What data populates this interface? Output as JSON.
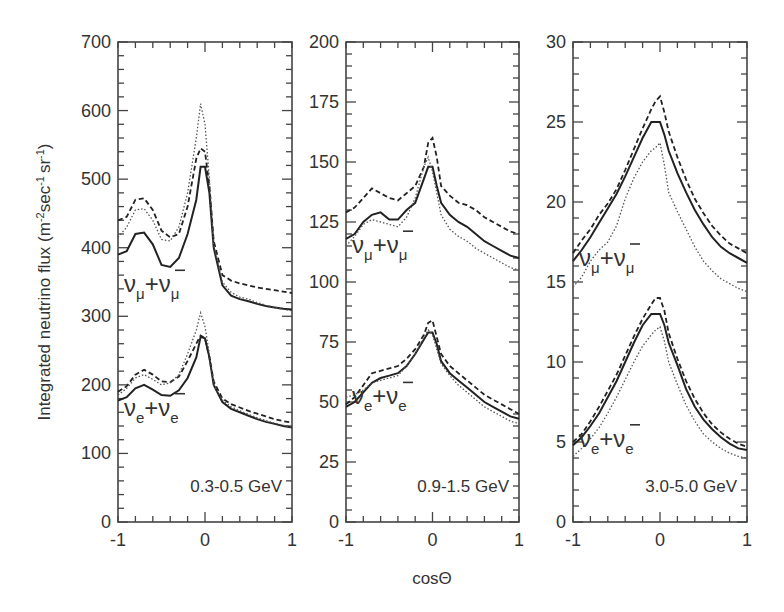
{
  "chart_data": [
    {
      "type": "line",
      "title": "0.3-0.5 GeV",
      "xlabel": "cosΘ",
      "ylabel": "Integrated neutrino flux (m^-2 sec^-1 sr^-1)",
      "xlim": [
        -1,
        1
      ],
      "ylim": [
        0,
        700
      ],
      "yticks": [
        0,
        100,
        200,
        300,
        400,
        500,
        600,
        700
      ],
      "xticks": [
        -1,
        0,
        1
      ],
      "x": [
        -1,
        -0.9,
        -0.8,
        -0.7,
        -0.6,
        -0.5,
        -0.4,
        -0.3,
        -0.2,
        -0.1,
        -0.05,
        0,
        0.05,
        0.1,
        0.2,
        0.3,
        0.4,
        0.5,
        0.6,
        0.7,
        0.8,
        0.9,
        1
      ],
      "groups": [
        {
          "label": "νμ+ν̄μ",
          "series": [
            {
              "name": "solid",
              "values": [
                390,
                395,
                420,
                422,
                405,
                375,
                372,
                385,
                420,
                470,
                518,
                518,
                480,
                400,
                345,
                330,
                325,
                322,
                318,
                315,
                313,
                311,
                310
              ]
            },
            {
              "name": "dashed",
              "values": [
                440,
                445,
                470,
                472,
                455,
                425,
                415,
                420,
                460,
                530,
                545,
                540,
                490,
                410,
                360,
                352,
                348,
                345,
                342,
                340,
                338,
                336,
                334
              ]
            },
            {
              "name": "dotted",
              "values": [
                415,
                430,
                455,
                457,
                440,
                412,
                410,
                430,
                480,
                560,
                610,
                580,
                500,
                405,
                350,
                335,
                328,
                325,
                320,
                316,
                313,
                310,
                308
              ]
            }
          ]
        },
        {
          "label": "νe+ν̄e",
          "series": [
            {
              "name": "solid",
              "values": [
                177,
                182,
                195,
                200,
                193,
                185,
                184,
                192,
                210,
                240,
                270,
                268,
                240,
                200,
                175,
                165,
                160,
                155,
                150,
                146,
                143,
                140,
                138
              ]
            },
            {
              "name": "dashed",
              "values": [
                190,
                198,
                215,
                222,
                215,
                205,
                204,
                212,
                235,
                260,
                272,
                268,
                240,
                205,
                180,
                172,
                167,
                162,
                158,
                154,
                150,
                147,
                145
              ]
            },
            {
              "name": "dotted",
              "values": [
                185,
                195,
                210,
                215,
                208,
                200,
                203,
                215,
                245,
                280,
                305,
                285,
                245,
                200,
                178,
                168,
                162,
                157,
                152,
                148,
                144,
                141,
                138
              ]
            }
          ]
        }
      ]
    },
    {
      "type": "line",
      "title": "0.9-1.5 GeV",
      "xlabel": "cosΘ",
      "xlim": [
        -1,
        1
      ],
      "ylim": [
        0,
        200
      ],
      "yticks": [
        0,
        25,
        50,
        75,
        100,
        125,
        150,
        175,
        200
      ],
      "xticks": [
        -1,
        0,
        1
      ],
      "x": [
        -1,
        -0.9,
        -0.8,
        -0.7,
        -0.6,
        -0.5,
        -0.4,
        -0.3,
        -0.2,
        -0.1,
        -0.05,
        0,
        0.05,
        0.1,
        0.2,
        0.3,
        0.4,
        0.5,
        0.6,
        0.7,
        0.8,
        0.9,
        1
      ],
      "groups": [
        {
          "label": "νμ+ν̄μ",
          "series": [
            {
              "name": "solid",
              "values": [
                118,
                120,
                125,
                128,
                129,
                126,
                126,
                130,
                133,
                143,
                148,
                148,
                140,
                133,
                128,
                125,
                123,
                120,
                117,
                115,
                113,
                111,
                110
              ]
            },
            {
              "name": "dashed",
              "values": [
                129,
                131,
                135,
                139,
                137,
                135,
                134,
                137,
                140,
                148,
                158,
                160,
                152,
                140,
                136,
                133,
                132,
                130,
                127,
                125,
                123,
                121,
                120
              ]
            },
            {
              "name": "dotted",
              "values": [
                115,
                119,
                124,
                126,
                125,
                124,
                123,
                127,
                135,
                148,
                152,
                146,
                137,
                128,
                122,
                119,
                117,
                114,
                112,
                110,
                108,
                106,
                105
              ]
            }
          ]
        },
        {
          "label": "νe+ν̄e",
          "series": [
            {
              "name": "solid",
              "values": [
                48,
                50,
                54,
                58,
                60,
                61,
                62,
                65,
                70,
                76,
                79,
                79,
                74,
                67,
                62,
                59,
                56,
                53,
                50,
                48,
                46,
                44,
                43
              ]
            },
            {
              "name": "dashed",
              "values": [
                49,
                52,
                57,
                62,
                63,
                64,
                65,
                68,
                72,
                78,
                83,
                84,
                77,
                70,
                65,
                62,
                59,
                56,
                53,
                51,
                49,
                47,
                45
              ]
            },
            {
              "name": "dotted",
              "values": [
                52,
                53,
                55,
                58,
                59,
                60,
                61,
                65,
                70,
                77,
                80,
                78,
                72,
                66,
                61,
                57,
                54,
                51,
                48,
                46,
                44,
                42,
                41
              ]
            }
          ]
        }
      ]
    },
    {
      "type": "line",
      "title": "3.0-5.0 GeV",
      "xlabel": "cosΘ",
      "xlim": [
        -1,
        1
      ],
      "ylim": [
        0,
        30
      ],
      "yticks": [
        0,
        5,
        10,
        15,
        20,
        25,
        30
      ],
      "xticks": [
        -1,
        0,
        1
      ],
      "x": [
        -1,
        -0.9,
        -0.8,
        -0.7,
        -0.6,
        -0.5,
        -0.4,
        -0.3,
        -0.2,
        -0.1,
        -0.05,
        0,
        0.05,
        0.1,
        0.2,
        0.3,
        0.4,
        0.5,
        0.6,
        0.7,
        0.8,
        0.9,
        1
      ],
      "groups": [
        {
          "label": "νμ+ν̄μ",
          "series": [
            {
              "name": "solid",
              "values": [
                16.3,
                17.0,
                17.8,
                18.7,
                19.6,
                20.5,
                21.6,
                22.8,
                24.0,
                25.0,
                25.0,
                25.0,
                24.2,
                23.2,
                21.8,
                20.6,
                19.5,
                18.6,
                17.8,
                17.2,
                16.8,
                16.5,
                16.2
              ]
            },
            {
              "name": "dashed",
              "values": [
                16.8,
                17.6,
                18.3,
                19.2,
                19.9,
                20.8,
                22.0,
                23.3,
                24.6,
                25.8,
                26.3,
                26.6,
                25.6,
                24.4,
                22.8,
                21.4,
                20.2,
                19.3,
                18.5,
                17.9,
                17.4,
                17.1,
                16.8
              ]
            },
            {
              "name": "dotted",
              "values": [
                14.7,
                15.3,
                16.3,
                17.0,
                17.5,
                18.5,
                20.2,
                21.5,
                22.5,
                23.2,
                23.4,
                23.7,
                22.3,
                20.6,
                19.4,
                18.3,
                17.2,
                16.3,
                15.7,
                15.2,
                14.9,
                14.6,
                14.4
              ]
            }
          ]
        },
        {
          "label": "νe+ν̄e",
          "series": [
            {
              "name": "solid",
              "values": [
                4.8,
                5.3,
                6.0,
                6.8,
                7.8,
                8.8,
                10.0,
                11.2,
                12.3,
                13.0,
                13.0,
                13.0,
                12.3,
                11.2,
                9.8,
                8.3,
                7.2,
                6.4,
                5.8,
                5.3,
                4.9,
                4.6,
                4.5
              ]
            },
            {
              "name": "dashed",
              "values": [
                5.0,
                5.5,
                6.3,
                7.2,
                8.2,
                9.2,
                10.4,
                11.6,
                12.7,
                13.6,
                14.0,
                14.0,
                13.2,
                11.8,
                10.2,
                8.8,
                7.7,
                6.8,
                6.1,
                5.6,
                5.2,
                4.9,
                4.7
              ]
            },
            {
              "name": "dotted",
              "values": [
                4.1,
                4.6,
                5.2,
                5.9,
                6.8,
                7.8,
                8.9,
                10.0,
                11.0,
                11.7,
                12.0,
                12.2,
                11.3,
                10.0,
                8.6,
                7.3,
                6.3,
                5.5,
                5.0,
                4.6,
                4.3,
                4.1,
                4.0
              ]
            }
          ]
        }
      ]
    }
  ],
  "axes": {
    "ylabel": "Integrated neutrino flux (m",
    "ylabel_sup1": "-2",
    "ylabel_mid": "sec",
    "ylabel_sup2": "-1",
    "ylabel_mid2": "sr",
    "ylabel_sup3": "-1",
    "ylabel_end": ")",
    "xlabel": "cosΘ"
  },
  "panels": [
    {
      "energy_label": "0.3-0.5 GeV",
      "yticks": [
        "0",
        "100",
        "200",
        "300",
        "400",
        "500",
        "600",
        "700"
      ],
      "xticks": [
        "-1",
        "0",
        "1"
      ],
      "upper_label": {
        "nu": "ν",
        "sub1": "μ",
        "plus": "+ν",
        "sub2": "μ"
      },
      "lower_label": {
        "nu": "ν",
        "sub1": "e",
        "plus": "+ν",
        "sub2": "e"
      }
    },
    {
      "energy_label": "0.9-1.5 GeV",
      "yticks": [
        "0",
        "25",
        "50",
        "75",
        "100",
        "125",
        "150",
        "175",
        "200"
      ],
      "xticks": [
        "-1",
        "0",
        "1"
      ],
      "upper_label": {
        "nu": "ν",
        "sub1": "μ",
        "plus": "+ν",
        "sub2": "μ"
      },
      "lower_label": {
        "nu": "ν",
        "sub1": "e",
        "plus": "+ν",
        "sub2": "e"
      }
    },
    {
      "energy_label": "3.0-5.0 GeV",
      "yticks": [
        "0",
        "5",
        "10",
        "15",
        "20",
        "25",
        "30"
      ],
      "xticks": [
        "-1",
        "0",
        "1"
      ],
      "upper_label": {
        "nu": "ν",
        "sub1": "μ",
        "plus": "+ν",
        "sub2": "μ"
      },
      "lower_label": {
        "nu": "ν",
        "sub1": "e",
        "plus": "+ν",
        "sub2": "e"
      }
    }
  ]
}
